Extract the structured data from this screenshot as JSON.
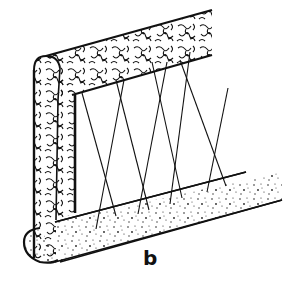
{
  "figure": {
    "label": "b",
    "colors": {
      "ink": "#111111",
      "background": "#ffffff"
    }
  }
}
